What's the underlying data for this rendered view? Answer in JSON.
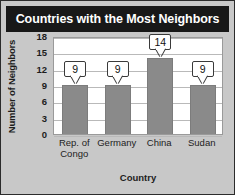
{
  "chart": {
    "title": "Countries with the Most Neighbors",
    "xlabel": "Country",
    "ylabel": "Number of Neighbors"
  },
  "chart_data": {
    "type": "bar",
    "title": "Countries with the Most Neighbors",
    "xlabel": "Country",
    "ylabel": "Number of Neighbors",
    "categories": [
      "Rep. of Congo",
      "Germany",
      "China",
      "Sudan"
    ],
    "category_lines": [
      [
        "Rep. of",
        "Congo"
      ],
      [
        "Germany"
      ],
      [
        "China"
      ],
      [
        "Sudan"
      ]
    ],
    "values": [
      9,
      9,
      14,
      9
    ],
    "data_labels": [
      "9",
      "9",
      "14",
      "9"
    ],
    "ylim": [
      0,
      18
    ],
    "yticks": [
      18,
      15,
      12,
      9,
      6,
      3,
      0
    ],
    "ytick_labels": [
      "18",
      "15",
      "12",
      "9",
      "6",
      "3",
      "0"
    ],
    "grid": "horizontal",
    "legend": "none",
    "colors": {
      "bar": "#8a8a8a",
      "bar_edge": "#7c7c7c",
      "plot_background": "#ffffff",
      "figure_background": "#c8c8c8",
      "title_banner": "#181818",
      "title_text": "#ffffff",
      "gridline": "#b9b9b9",
      "axis_text": "#1d1d1d",
      "callout_border": "#3a3a3a"
    }
  }
}
